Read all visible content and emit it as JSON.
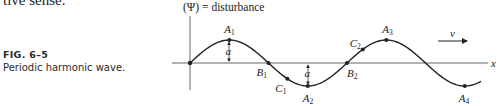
{
  "page": {
    "clipped_text": "tive sense."
  },
  "caption": {
    "figure_number": "FIG. 6–5",
    "title": "Periodic harmonic wave."
  },
  "diagram": {
    "y_axis_label": "(Ψ) = disturbance",
    "x_axis_label": "x",
    "velocity_label": "v",
    "amplitude_label": "a",
    "points": [
      {
        "name": "A",
        "sub": "1",
        "kind": "crest"
      },
      {
        "name": "B",
        "sub": "1",
        "kind": "node"
      },
      {
        "name": "C",
        "sub": "1",
        "kind": "intermediate"
      },
      {
        "name": "A",
        "sub": "2",
        "kind": "trough"
      },
      {
        "name": "B",
        "sub": "2",
        "kind": "node"
      },
      {
        "name": "C",
        "sub": "2",
        "kind": "intermediate"
      },
      {
        "name": "A",
        "sub": "3",
        "kind": "crest"
      },
      {
        "name": "A",
        "sub": "4",
        "kind": "trough"
      }
    ],
    "colors": {
      "line": "#222222",
      "axis": "#555555"
    }
  }
}
